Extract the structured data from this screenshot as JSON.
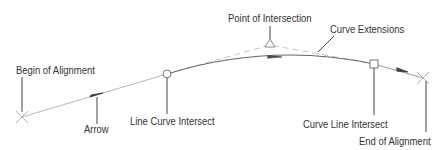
{
  "diagram": {
    "type": "road-alignment-annotation",
    "labels": {
      "begin": "Begin of Alignment",
      "arrow": "Arrow",
      "line_curve": "Line Curve Intersect",
      "pi": "Point of Intersection",
      "extensions": "Curve Extensions",
      "curve_line": "Curve Line Intersect",
      "end": "End of Alignment"
    },
    "markers": {
      "begin": {
        "shape": "x",
        "x": 22,
        "y": 117
      },
      "line_curve": {
        "shape": "circle",
        "x": 167,
        "y": 74
      },
      "pi": {
        "shape": "triangle",
        "x": 270,
        "y": 44
      },
      "curve_line": {
        "shape": "square",
        "x": 374,
        "y": 64
      },
      "end": {
        "shape": "x",
        "x": 423,
        "y": 78
      }
    },
    "colors": {
      "line": "#b0b0b0",
      "curve": "#555555",
      "leader": "#444444",
      "text": "#333333"
    }
  }
}
